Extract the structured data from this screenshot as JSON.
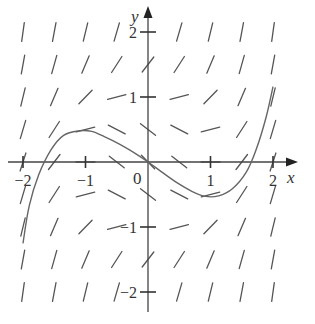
{
  "figure": {
    "type": "slope-field",
    "equation_implied": "y' = x^2 + y^2 - 1",
    "axes": {
      "x_label": "x",
      "y_label": "y",
      "origin_label": "0",
      "x_ticks": [
        {
          "value": -2,
          "label": "−2"
        },
        {
          "value": -1,
          "label": "−1"
        },
        {
          "value": 1,
          "label": "1"
        },
        {
          "value": 2,
          "label": "2"
        }
      ],
      "y_ticks": [
        {
          "value": 2,
          "label": "2"
        },
        {
          "value": 1,
          "label": "1"
        },
        {
          "value": -1,
          "label": "−1"
        },
        {
          "value": -2,
          "label": "−2"
        }
      ]
    }
  },
  "chart_data": {
    "type": "slope_field",
    "title": "",
    "xlabel": "x",
    "ylabel": "y",
    "xlim": [
      -2.1,
      2.3
    ],
    "ylim": [
      -2.2,
      2.3
    ],
    "grid": false,
    "field_grid": {
      "x": [
        -2,
        -1.5,
        -1,
        -0.5,
        0,
        0.5,
        1,
        1.5,
        2
      ],
      "y": [
        2,
        1.5,
        1,
        0.5,
        0,
        -0.5,
        -1,
        -1.5,
        -2
      ],
      "slope_formula": "x^2 + y^2 - 1"
    },
    "solution_curve": {
      "x": [
        -2.0,
        -1.9,
        -1.75,
        -1.55,
        -1.35,
        -1.1,
        -0.9,
        -0.7,
        -0.45,
        -0.2,
        0.0,
        0.2,
        0.45,
        0.7,
        0.92,
        1.13,
        1.35,
        1.57,
        1.73,
        1.89,
        2.0
      ],
      "y": [
        -1.25,
        -0.67,
        -0.2,
        0.19,
        0.41,
        0.48,
        0.47,
        0.39,
        0.27,
        0.13,
        0.0,
        -0.14,
        -0.31,
        -0.45,
        -0.53,
        -0.52,
        -0.41,
        -0.16,
        0.19,
        0.69,
        1.16
      ]
    }
  }
}
